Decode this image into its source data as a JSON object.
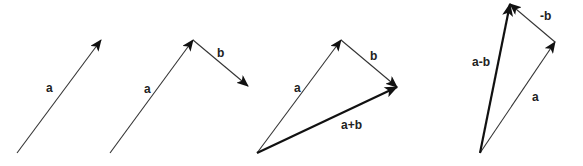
{
  "diagram": {
    "colors": {
      "stroke": "#333333",
      "text": "#222222",
      "background": "#ffffff"
    },
    "panels": [
      {
        "id": "vector-a",
        "vectors": [
          {
            "label": "a",
            "from": [
              17,
              153
            ],
            "to": [
              101,
              40
            ],
            "weight": "thin"
          }
        ],
        "labels": {
          "a": "a"
        }
      },
      {
        "id": "head-to-tail",
        "vectors": [
          {
            "label": "a",
            "from": [
              110,
              153
            ],
            "to": [
              193,
              40
            ],
            "weight": "thin"
          },
          {
            "label": "b",
            "from": [
              193,
              40
            ],
            "to": [
              248,
              86
            ],
            "weight": "thin"
          }
        ],
        "labels": {
          "a": "a",
          "b": "b"
        }
      },
      {
        "id": "sum",
        "vectors": [
          {
            "label": "a",
            "from": [
              257,
              153
            ],
            "to": [
              341,
              40
            ],
            "weight": "thin"
          },
          {
            "label": "b",
            "from": [
              341,
              40
            ],
            "to": [
              397,
              87
            ],
            "weight": "thin"
          },
          {
            "label": "a+b",
            "from": [
              257,
              153
            ],
            "to": [
              397,
              87
            ],
            "weight": "thick"
          }
        ],
        "labels": {
          "a": "a",
          "b": "b",
          "sum": "a+b"
        }
      },
      {
        "id": "difference",
        "vectors": [
          {
            "label": "a",
            "from": [
              480,
              153
            ],
            "to": [
              555,
              42
            ],
            "weight": "thin"
          },
          {
            "label": "-b",
            "from": [
              555,
              42
            ],
            "to": [
              510,
              4
            ],
            "weight": "thin"
          },
          {
            "label": "a-b",
            "from": [
              480,
              153
            ],
            "to": [
              510,
              4
            ],
            "weight": "thick"
          }
        ],
        "labels": {
          "a": "a",
          "neg_b": "-b",
          "diff": "a-b"
        }
      }
    ]
  }
}
